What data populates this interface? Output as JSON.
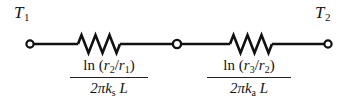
{
  "figure": {
    "type": "thermal-resistance-network",
    "background_color": "#ffffff",
    "line_color": "#111111"
  },
  "terminals": {
    "left": {
      "label_symbol": "T",
      "label_subscript": "1",
      "node_x": 30,
      "node_y": 44
    },
    "middle": {
      "node_x": 177,
      "node_y": 44
    },
    "right": {
      "label_symbol": "T",
      "label_subscript": "2",
      "node_x": 328,
      "node_y": 44
    }
  },
  "resistors": [
    {
      "name": "cylinder-wall-resistance",
      "zigzag_start_x": 78,
      "zigzag_end_x": 120,
      "numerator": {
        "function": "ln",
        "open_paren": "(",
        "var1": "r",
        "sub1": "2",
        "slash": "/",
        "var2": "r",
        "sub2": "1",
        "close_paren": ")"
      },
      "denominator": {
        "coefficient": "2",
        "pi": "π",
        "conductivity": "k",
        "conductivity_sub": "s",
        "length": "L"
      }
    },
    {
      "name": "insulation-resistance",
      "zigzag_start_x": 230,
      "zigzag_end_x": 272,
      "numerator": {
        "function": "ln",
        "open_paren": "(",
        "var1": "r",
        "sub1": "3",
        "slash": "/",
        "var2": "r",
        "sub2": "2",
        "close_paren": ")"
      },
      "denominator": {
        "coefficient": "2",
        "pi": "π",
        "conductivity": "k",
        "conductivity_sub": "a",
        "length": "L"
      }
    }
  ]
}
